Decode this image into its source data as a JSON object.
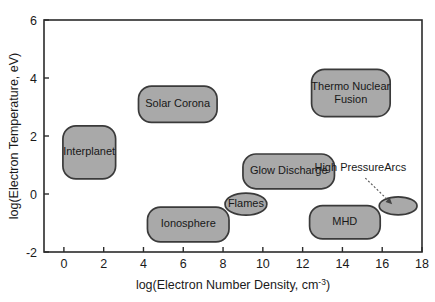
{
  "chart_data": {
    "type": "scatter",
    "title": "",
    "xlabel_prefix": "log(Electron Number Density, cm",
    "xlabel_sup": "-3",
    "xlabel_suffix": ")",
    "xlabel": "log(Electron Number Density, cm^-3)",
    "ylabel": "log(Electron Temperature, eV)",
    "xlim": [
      -1,
      18
    ],
    "ylim": [
      -2,
      6
    ],
    "xticks": [
      0,
      2,
      4,
      6,
      8,
      10,
      12,
      14,
      16,
      18
    ],
    "xtick_labels": [
      "0",
      "2",
      "4",
      "6",
      "8",
      "10",
      "12",
      "14",
      "16",
      "18"
    ],
    "yticks": [
      -2,
      0,
      2,
      4,
      6
    ],
    "ytick_labels": [
      "-2",
      "0",
      "2",
      "4",
      "6"
    ],
    "grid": false,
    "legend": "none",
    "fill_color": "#a9a9a9",
    "stroke_color": "#3a3a3a",
    "regions": [
      {
        "label": "Interplanet",
        "shape": "rounded-rect",
        "x_range": [
          -0.05,
          2.6
        ],
        "y_range": [
          0.52,
          2.35
        ],
        "label_x": 1.27,
        "label_y": 1.43
      },
      {
        "label": "Solar Corona",
        "shape": "rounded-rect",
        "x_range": [
          3.75,
          7.7
        ],
        "y_range": [
          2.47,
          3.72
        ],
        "label_x": 5.72,
        "label_y": 3.1
      },
      {
        "label": "Glow Discharge",
        "shape": "rounded-rect",
        "x_range": [
          9.0,
          13.6
        ],
        "y_range": [
          0.18,
          1.38
        ],
        "label_x": 11.3,
        "label_y": 0.78
      },
      {
        "label": "Thermo Nuclear Fusion",
        "label_line1": "Thermo Nuclear",
        "label_line2": "Fusion",
        "shape": "rounded-rect",
        "x_range": [
          12.45,
          16.4
        ],
        "y_range": [
          2.67,
          4.3
        ],
        "label_x": 14.42,
        "label_y": 3.48
      },
      {
        "label": "Ionosphere",
        "shape": "rounded-rect",
        "x_range": [
          4.2,
          8.3
        ],
        "y_range": [
          -1.65,
          -0.45
        ],
        "label_x": 6.25,
        "label_y": -1.05
      },
      {
        "label": "Flames",
        "shape": "ellipse",
        "x_range": [
          8.1,
          10.2
        ],
        "y_range": [
          -0.73,
          0.03
        ],
        "label_x": 9.15,
        "label_y": -0.35
      },
      {
        "label": "MHD",
        "shape": "rounded-rect",
        "x_range": [
          12.35,
          15.9
        ],
        "y_range": [
          -1.55,
          -0.4
        ],
        "label_x": 14.12,
        "label_y": -0.98
      },
      {
        "label": "",
        "shape": "ellipse",
        "x_range": [
          15.85,
          17.75
        ],
        "y_range": [
          -0.72,
          -0.1
        ],
        "label_x": 16.8,
        "label_y": -0.41
      }
    ],
    "annotations": [
      {
        "text": "High PressureArcs",
        "text_x": 14.9,
        "text_y": 0.78,
        "arrow_from_x": 15.15,
        "arrow_from_y": 0.55,
        "arrow_to_x": 16.5,
        "arrow_to_y": -0.35
      }
    ]
  }
}
